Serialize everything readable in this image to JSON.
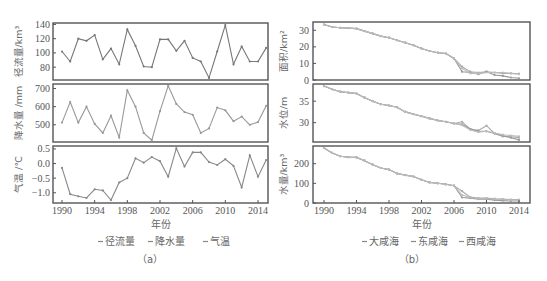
{
  "chart_data": [
    {
      "panel": "a",
      "caption": "（a）",
      "xlabel": "年份",
      "x_ticks": [
        1990,
        1994,
        1998,
        2002,
        2006,
        2010,
        2014
      ],
      "x": [
        1990,
        1991,
        1992,
        1993,
        1994,
        1995,
        1996,
        1997,
        1998,
        1999,
        2000,
        2001,
        2002,
        2003,
        2004,
        2005,
        2006,
        2007,
        2008,
        2009,
        2010,
        2011,
        2012,
        2013,
        2014,
        2015
      ],
      "legend": [
        "径流量",
        "降水量",
        "气温"
      ],
      "subplots": [
        {
          "type": "line",
          "name": "径流量",
          "ylabel": "径流量/km³",
          "ylim": [
            62,
            142
          ],
          "y_ticks": [
            80,
            100,
            120,
            140
          ],
          "color": "#777777",
          "values": [
            102,
            88,
            120,
            117,
            125,
            91,
            106,
            84,
            133,
            110,
            81,
            80,
            119,
            119,
            103,
            117,
            93,
            88,
            65,
            102,
            139,
            84,
            109,
            88,
            88,
            107
          ]
        },
        {
          "type": "line",
          "name": "降水量",
          "ylabel": "降水量 /mm",
          "ylim": [
            405,
            725
          ],
          "y_ticks": [
            500,
            600,
            700
          ],
          "color": "#999999",
          "values": [
            512,
            625,
            512,
            600,
            505,
            455,
            550,
            430,
            690,
            600,
            455,
            415,
            575,
            715,
            615,
            570,
            555,
            455,
            480,
            595,
            580,
            520,
            545,
            500,
            515,
            605
          ]
        },
        {
          "type": "line",
          "name": "气温",
          "ylabel": "气温 /℃",
          "ylim": [
            -1.35,
            0.6
          ],
          "y_ticks": [
            -1.0,
            -0.5,
            0.0,
            0.5
          ],
          "color": "#888888",
          "values": [
            -0.15,
            -1.05,
            -1.12,
            -1.18,
            -0.88,
            -0.92,
            -1.25,
            -0.65,
            -0.5,
            0.18,
            0.03,
            0.22,
            0.08,
            -0.45,
            0.52,
            -0.1,
            0.38,
            0.38,
            0.05,
            -0.05,
            0.15,
            -0.08,
            -0.82,
            0.28,
            -0.45,
            0.12
          ]
        }
      ]
    },
    {
      "panel": "b",
      "caption": "（b）",
      "xlabel": "年份",
      "x_ticks": [
        1990,
        1994,
        1998,
        2002,
        2006,
        2010,
        2014
      ],
      "x": [
        1990,
        1991,
        1992,
        1993,
        1994,
        1995,
        1996,
        1997,
        1998,
        1999,
        2000,
        2001,
        2002,
        2003,
        2004,
        2005,
        2006,
        2007,
        2008,
        2009,
        2010,
        2011,
        2012,
        2013,
        2014
      ],
      "legend": [
        "大咸海",
        "东咸海",
        "西咸海"
      ],
      "subplots": [
        {
          "type": "line",
          "name": "面积",
          "ylabel": "面积/km²",
          "ylim": [
            0,
            35
          ],
          "y_ticks": [
            0,
            10,
            20,
            30
          ],
          "series": [
            {
              "name": "大咸海",
              "color": "#aaaaaa",
              "values": [
                33.5,
                32,
                31.5,
                31.3,
                31,
                29.5,
                28,
                26.5,
                25.5,
                24,
                22.5,
                21,
                19,
                17.5,
                16.5,
                16,
                13,
                8,
                5,
                4.5,
                5,
                4.5,
                4,
                4,
                3.8
              ]
            },
            {
              "name": "东咸海",
              "color": "#999999",
              "values": [
                33.5,
                32,
                31.5,
                31.3,
                31,
                29.5,
                28,
                26.5,
                25.5,
                24,
                22.5,
                21,
                19,
                17.5,
                16.5,
                16,
                13,
                5,
                4.5,
                3.5,
                5,
                3,
                2.5,
                1.5,
                1
              ]
            },
            {
              "name": "西咸海",
              "color": "#bbbbbb",
              "values": [
                33.5,
                32,
                31.5,
                31.3,
                31,
                29.5,
                28,
                26.5,
                25.5,
                24,
                22.5,
                21,
                19,
                17.5,
                16.5,
                16,
                13,
                7,
                4,
                4,
                4.5,
                4.5,
                4.5,
                4,
                3.5
              ]
            }
          ]
        },
        {
          "type": "line",
          "name": "水位",
          "ylabel": "水位/m",
          "ylim": [
            25.5,
            39
          ],
          "y_ticks": [
            30,
            35
          ],
          "series": [
            {
              "name": "大咸海",
              "color": "#aaaaaa",
              "values": [
                38.5,
                37.8,
                37.2,
                37,
                36.8,
                35.8,
                35,
                34.3,
                34,
                33.6,
                32.5,
                32,
                31.5,
                31,
                30.5,
                30.2,
                29.8,
                30.2,
                28.5,
                28.2,
                29.3,
                27.5,
                26.8,
                26.7,
                26.5
              ]
            },
            {
              "name": "东咸海",
              "color": "#999999",
              "values": [
                38.5,
                37.8,
                37.2,
                37,
                36.8,
                35.8,
                35,
                34.3,
                34,
                33.6,
                32.5,
                32,
                31.5,
                31,
                30.5,
                30.2,
                29.8,
                29.6,
                28.5,
                28,
                28,
                27.5,
                27,
                26.5,
                26
              ]
            },
            {
              "name": "西咸海",
              "color": "#bbbbbb",
              "values": [
                38.5,
                37.8,
                37.2,
                37,
                36.8,
                35.8,
                35,
                34.3,
                34,
                33.6,
                32.5,
                32,
                31.5,
                31,
                30.5,
                30.2,
                29.8,
                29.4,
                28.3,
                27.8,
                28,
                27.6,
                27.2,
                27,
                26.8
              ]
            }
          ]
        },
        {
          "type": "line",
          "name": "水量",
          "ylabel": "水量/km³",
          "ylim": [
            0,
            290
          ],
          "y_ticks": [
            0,
            100,
            200
          ],
          "series": [
            {
              "name": "大咸海",
              "color": "#aaaaaa",
              "values": [
                280,
                255,
                238,
                233,
                232,
                215,
                195,
                178,
                170,
                150,
                142,
                135,
                118,
                105,
                100,
                95,
                88,
                60,
                30,
                25,
                25,
                22,
                20,
                18,
                18
              ]
            },
            {
              "name": "东咸海",
              "color": "#999999",
              "values": [
                280,
                255,
                238,
                233,
                232,
                215,
                195,
                178,
                170,
                150,
                142,
                135,
                118,
                105,
                100,
                95,
                88,
                28,
                25,
                20,
                20,
                15,
                12,
                10,
                10
              ]
            },
            {
              "name": "西咸海",
              "color": "#bbbbbb",
              "values": [
                280,
                255,
                238,
                233,
                232,
                215,
                195,
                178,
                170,
                150,
                142,
                135,
                118,
                105,
                100,
                95,
                88,
                40,
                28,
                22,
                22,
                20,
                18,
                16,
                15
              ]
            }
          ]
        }
      ]
    }
  ]
}
